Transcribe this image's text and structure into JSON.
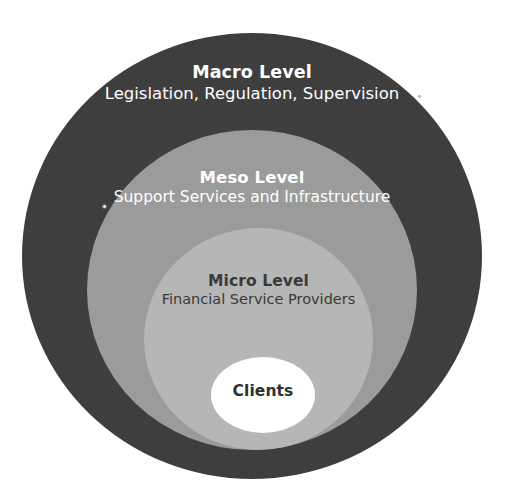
{
  "diagram": {
    "name": "concentric-levels-diagram",
    "type": "onion-diagram",
    "background_color": "#ffffff",
    "layers": [
      {
        "key": "macro",
        "title": "Macro Level",
        "subtitle": "Legislation, Regulation, Supervision",
        "fill_color": "#3e3e3e",
        "text_color": "#ffffff"
      },
      {
        "key": "meso",
        "title": "Meso Level",
        "subtitle": "Support Services and Infrastructure",
        "fill_color": "#9b9b9b",
        "text_color": "#ffffff"
      },
      {
        "key": "micro",
        "title": "Micro Level",
        "subtitle": "Financial Service Providers",
        "fill_color": "#b6b6b6",
        "text_color": "#3a3a3a"
      },
      {
        "key": "clients",
        "title": "Clients",
        "subtitle": "",
        "fill_color": "#ffffff",
        "text_color": "#2f2f2f"
      }
    ]
  }
}
